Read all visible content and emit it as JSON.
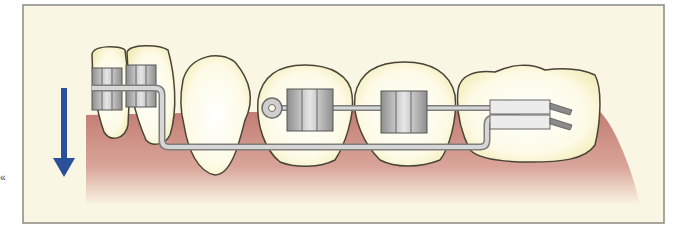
{
  "figure": {
    "type": "orthodontic-illustration",
    "colors": {
      "background": "#faf6e4",
      "frame": "#8a8a82",
      "gum": "#c98a80",
      "tooth": "#fdfbe8",
      "tooth_outline": "#4a4438",
      "wire": "#b8b8b8",
      "bracket": "#a8a8a8",
      "arrow": "#2c4f9a"
    },
    "labels": {
      "margin_mark": "«"
    },
    "elements": {
      "arrow": "downward-arrow",
      "teeth_count": 5,
      "brackets_count": 4,
      "molar_tube_count": 1
    }
  }
}
